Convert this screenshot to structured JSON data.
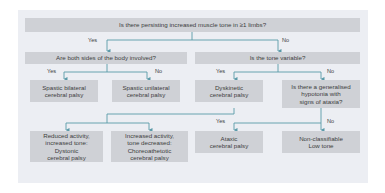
{
  "diagram": {
    "colors": {
      "panel_bg": "#eceef3",
      "box_bg": "#cfd1d6",
      "connector": "#5a9aa8",
      "text": "#3d3d3d"
    },
    "root": {
      "question": "Is there persisting increased muscle tone in ≥1 limbs?"
    },
    "branch_labels": {
      "yes": "Yes",
      "no": "No"
    },
    "level2": {
      "left": {
        "question": "Are both sides of the body involved?"
      },
      "right": {
        "question": "Is the tone variable?"
      }
    },
    "level3": {
      "spastic_bilateral": {
        "line1": "Spastic bilateral",
        "line2": "cerebral palsy"
      },
      "spastic_unilateral": {
        "line1": "Spastic unilateral",
        "line2": "cerebral palsy"
      },
      "dyskinetic": {
        "line1": "Dyskinetic",
        "line2": "cerebral palsy"
      },
      "hypotonia_question": {
        "line1": "Is there a generalised",
        "line2": "hypotonia with",
        "line3": "signs of ataxia?"
      }
    },
    "level4": {
      "dystonic": {
        "line1": "Reduced activity,",
        "line2": "increased tone:",
        "line3": "Dystonic",
        "line4": "cerebral palsy"
      },
      "choreoathetotic": {
        "line1": "Increased activity,",
        "line2": "tone decreased:",
        "line3": "Choreoathetotic",
        "line4": "cerebral palsy"
      },
      "ataxic": {
        "line1": "Ataxic",
        "line2": "cerebral palsy"
      },
      "non_classifiable": {
        "line1": "Non-classifiable",
        "line2": "Low tone"
      }
    }
  }
}
